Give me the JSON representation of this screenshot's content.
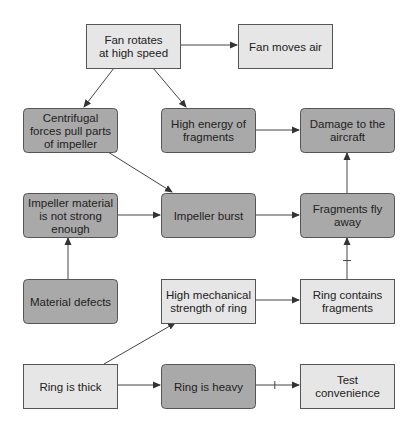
{
  "diagram": {
    "type": "cause-effect flowchart",
    "colors": {
      "light_fill": "#e6e6e6",
      "dark_fill": "#a9a9a9",
      "border": "#555555",
      "edge": "#444444"
    },
    "nodes": [
      {
        "id": "fan_rotates",
        "lines": [
          "Fan rotates",
          "at high speed"
        ],
        "style": "light"
      },
      {
        "id": "fan_moves_air",
        "lines": [
          "Fan moves air"
        ],
        "style": "light"
      },
      {
        "id": "centrifugal",
        "lines": [
          "Centrifugal",
          "forces pull parts",
          "of impeller"
        ],
        "style": "dark"
      },
      {
        "id": "high_energy",
        "lines": [
          "High energy of",
          "fragments"
        ],
        "style": "dark"
      },
      {
        "id": "damage",
        "lines": [
          "Damage to the",
          "aircraft"
        ],
        "style": "dark"
      },
      {
        "id": "impeller_material",
        "lines": [
          "Impeller material",
          "is not strong",
          "enough"
        ],
        "style": "dark"
      },
      {
        "id": "impeller_burst",
        "lines": [
          "Impeller burst"
        ],
        "style": "dark"
      },
      {
        "id": "fragments_fly",
        "lines": [
          "Fragments fly",
          "away"
        ],
        "style": "dark"
      },
      {
        "id": "material_defects",
        "lines": [
          "Material defects"
        ],
        "style": "dark"
      },
      {
        "id": "high_mech_strength",
        "lines": [
          "High mechanical",
          "strength of ring"
        ],
        "style": "light"
      },
      {
        "id": "ring_contains",
        "lines": [
          "Ring contains",
          "fragments"
        ],
        "style": "light"
      },
      {
        "id": "ring_thick",
        "lines": [
          "Ring is thick"
        ],
        "style": "light"
      },
      {
        "id": "ring_heavy",
        "lines": [
          "Ring is heavy"
        ],
        "style": "dark"
      },
      {
        "id": "test_convenience",
        "lines": [
          "Test",
          "convenience"
        ],
        "style": "light"
      }
    ],
    "edges": [
      {
        "from": "fan_rotates",
        "to": "fan_moves_air",
        "polarity": "positive"
      },
      {
        "from": "fan_rotates",
        "to": "centrifugal",
        "polarity": "positive"
      },
      {
        "from": "fan_rotates",
        "to": "high_energy",
        "polarity": "positive"
      },
      {
        "from": "high_energy",
        "to": "damage",
        "polarity": "positive"
      },
      {
        "from": "centrifugal",
        "to": "impeller_burst",
        "polarity": "positive"
      },
      {
        "from": "impeller_material",
        "to": "impeller_burst",
        "polarity": "positive"
      },
      {
        "from": "impeller_burst",
        "to": "fragments_fly",
        "polarity": "positive"
      },
      {
        "from": "fragments_fly",
        "to": "damage",
        "polarity": "positive"
      },
      {
        "from": "material_defects",
        "to": "impeller_material",
        "polarity": "positive"
      },
      {
        "from": "high_mech_strength",
        "to": "ring_contains",
        "polarity": "positive"
      },
      {
        "from": "ring_contains",
        "to": "fragments_fly",
        "polarity": "negative"
      },
      {
        "from": "ring_thick",
        "to": "high_mech_strength",
        "polarity": "positive"
      },
      {
        "from": "ring_thick",
        "to": "ring_heavy",
        "polarity": "positive"
      },
      {
        "from": "ring_heavy",
        "to": "test_convenience",
        "polarity": "negative"
      }
    ]
  }
}
